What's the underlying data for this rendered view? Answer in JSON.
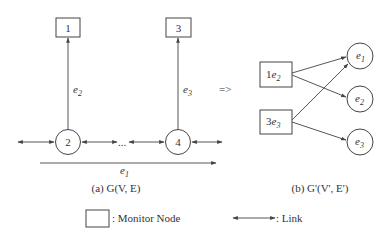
{
  "figure": {
    "left_panel": {
      "monitor_nodes": [
        {
          "id": "box-1",
          "label": "1"
        },
        {
          "id": "box-3",
          "label": "3"
        }
      ],
      "regular_nodes": [
        {
          "id": "circle-2",
          "label": "2"
        },
        {
          "id": "circle-4",
          "label": "4"
        }
      ],
      "edge_labels": {
        "e2": "e",
        "e2_sub": "2",
        "e3": "e",
        "e3_sub": "3",
        "e1": "e",
        "e1_sub": "1"
      },
      "ellipsis": "...",
      "caption": "(a) G(V, E)"
    },
    "transform_symbol": "=>",
    "right_panel": {
      "monitor_nodes": [
        {
          "id": "box-1e2",
          "num": "1",
          "e": "e",
          "sub": "2"
        },
        {
          "id": "box-3e3",
          "num": "3",
          "e": "e",
          "sub": "3"
        }
      ],
      "path_nodes": [
        {
          "id": "circle-e1",
          "e": "e",
          "sub": "1"
        },
        {
          "id": "circle-e2",
          "e": "e",
          "sub": "2"
        },
        {
          "id": "circle-e3",
          "e": "e",
          "sub": "3"
        }
      ],
      "edges": [
        {
          "from": "1e2",
          "to": "e1"
        },
        {
          "from": "1e2",
          "to": "e2"
        },
        {
          "from": "3e3",
          "to": "e1"
        },
        {
          "from": "3e3",
          "to": "e3"
        }
      ],
      "caption": "(b) G'(V', E')"
    },
    "legend": {
      "monitor_node_label": ": Monitor Node",
      "link_label": ": Link"
    },
    "colors": {
      "stroke": "#444444",
      "text": "#333333",
      "background": "#ffffff"
    }
  }
}
